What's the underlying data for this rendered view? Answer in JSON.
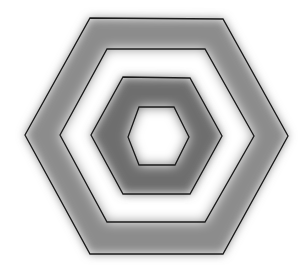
{
  "diagram": {
    "title": "",
    "background": "#ffffff",
    "stroke_color": "#1a1a1a",
    "hexagons": [
      {
        "id": "hex-outer",
        "points": "90,18 223,19 288,136 223,254 90,254 25,135"
      },
      {
        "id": "hex-second",
        "points": "107,49 205,49 254,136 205,222 107,222 60,135"
      },
      {
        "id": "hex-third",
        "points": "123,77 190,78 222,136 190,194 123,194 91,135"
      },
      {
        "id": "hex-inner",
        "points": "139,107 174,107 189,137 175,165 139,165 128,137"
      }
    ],
    "bands": [
      {
        "id": "band-outer",
        "fill": "#8c8c8c",
        "label": "outer gray ring"
      },
      {
        "id": "band-second",
        "fill": "#ffffff",
        "label": "white ring"
      },
      {
        "id": "band-third",
        "fill": "#6e6e6e",
        "label": "dark gray ring"
      },
      {
        "id": "band-center",
        "fill": "#ffffff",
        "label": "white center"
      }
    ]
  }
}
